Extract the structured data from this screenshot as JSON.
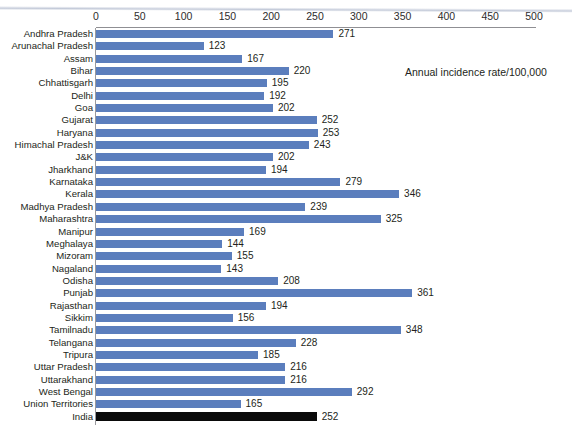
{
  "chart_data": {
    "type": "bar",
    "orientation": "horizontal",
    "title": "",
    "subtitle": "",
    "xlabel": "",
    "ylabel": "",
    "annotation": "Annual incidence rate/100,000",
    "xlim": [
      0,
      500
    ],
    "xticks": [
      0,
      50,
      100,
      150,
      200,
      250,
      300,
      350,
      400,
      450,
      500
    ],
    "xtick_labels": [
      "0",
      "50",
      "100",
      "150",
      "200",
      "250",
      "300",
      "350",
      "400",
      "450",
      "500"
    ],
    "grid": false,
    "legend": "none",
    "bar_color": "#5B7EBD",
    "highlight_color": "#0A0A0A",
    "highlight_category": "India",
    "categories": [
      "Andhra Pradesh",
      "Arunachal Pradesh",
      "Assam",
      "Bihar",
      "Chhattisgarh",
      "Delhi",
      "Goa",
      "Gujarat",
      "Haryana",
      "Himachal Pradesh",
      "J&K",
      "Jharkhand",
      "Karnataka",
      "Kerala",
      "Madhya Pradesh",
      "Maharashtra",
      "Manipur",
      "Meghalaya",
      "Mizoram",
      "Nagaland",
      "Odisha",
      "Punjab",
      "Rajasthan",
      "Sikkim",
      "Tamilnadu",
      "Telangana",
      "Tripura",
      "Uttar Pradesh",
      "Uttarakhand",
      "West Bengal",
      "Union Territories",
      "India"
    ],
    "values": [
      271,
      123,
      167,
      220,
      195,
      192,
      202,
      252,
      253,
      243,
      202,
      194,
      279,
      346,
      239,
      325,
      169,
      144,
      155,
      143,
      208,
      361,
      194,
      156,
      348,
      228,
      185,
      216,
      216,
      292,
      165,
      252
    ],
    "value_labels": [
      "271",
      "123",
      "167",
      "220",
      "195",
      "192",
      "202",
      "252",
      "253",
      "243",
      "202",
      "194",
      "279",
      "346",
      "239",
      "325",
      "169",
      "144",
      "155",
      "143",
      "208",
      "361",
      "194",
      "156",
      "348",
      "228",
      "185",
      "216",
      "216",
      "292",
      "165",
      "252"
    ]
  }
}
